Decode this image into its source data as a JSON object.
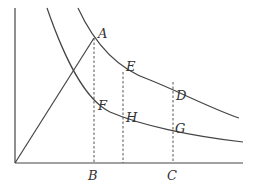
{
  "diagram": {
    "type": "economics-curves",
    "axes": {
      "origin": [
        15,
        163
      ],
      "y_top": [
        15,
        8
      ],
      "x_right": [
        243,
        163
      ]
    },
    "curves": [
      {
        "name": "upper-curve",
        "path": "M78,8 C95,45 120,70 150,80 C180,92 210,108 239,118"
      },
      {
        "name": "lower-curve",
        "path": "M47,8 C65,60 85,100 110,112 C140,125 190,136 243,142"
      }
    ],
    "ray": {
      "from": [
        15,
        163
      ],
      "to": [
        94,
        38
      ]
    },
    "dashed_lines": [
      {
        "name": "line-A-B",
        "x": 94,
        "y1": 38,
        "y2": 163
      },
      {
        "name": "line-E",
        "x": 123,
        "y1": 72,
        "y2": 163
      },
      {
        "name": "line-D-C",
        "x": 173,
        "y1": 82,
        "y2": 163
      }
    ],
    "labels": [
      {
        "text": "A",
        "x": 98,
        "y": 38
      },
      {
        "text": "E",
        "x": 126,
        "y": 71
      },
      {
        "text": "D",
        "x": 176,
        "y": 100
      },
      {
        "text": "F",
        "x": 98,
        "y": 110
      },
      {
        "text": "H",
        "x": 126,
        "y": 122
      },
      {
        "text": "G",
        "x": 175,
        "y": 133
      },
      {
        "text": "B",
        "x": 88,
        "y": 180
      },
      {
        "text": "C",
        "x": 167,
        "y": 180
      }
    ],
    "colors": {
      "line": "#444444",
      "dashed": "#555555",
      "text": "#333333"
    }
  }
}
